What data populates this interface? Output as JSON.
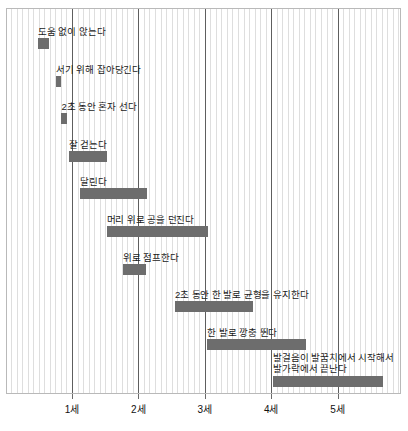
{
  "chart_data": {
    "type": "bar",
    "orientation": "horizontal",
    "title": "",
    "subtitle": "",
    "xlabel": "",
    "ylabel": "",
    "xlim": [
      0,
      5.9
    ],
    "grid": true,
    "grid_minor_step_months": 1,
    "legend": "none",
    "bar_color": "#6d6d6d",
    "axis_ticks": [
      {
        "value": 1,
        "label": "1세"
      },
      {
        "value": 2,
        "label": "2세"
      },
      {
        "value": 3,
        "label": "3세"
      },
      {
        "value": 4,
        "label": "4세"
      },
      {
        "value": 5,
        "label": "5세"
      }
    ],
    "categories": [
      "도움 없이 앉는다",
      "서기 위해 잡아당긴다",
      "2초 동안 혼자 선다",
      "잘 걷는다",
      "달린다",
      "머리 위로 공을 던진다",
      "위로 점프한다",
      "2초 동안 한 발로 균형을 유지한다",
      "한 발로 깡충 뛴다",
      "발걸음이 발꿈치에서 시작해서 발가락에서 끝난다"
    ],
    "bars": [
      {
        "label": "도움 없이 앉는다",
        "start": 0.49,
        "end": 0.66,
        "label_lines": [
          "도움 없이 앉는다"
        ]
      },
      {
        "label": "서기 위해 잡아당긴다",
        "start": 0.76,
        "end": 0.84,
        "label_lines": [
          "서기 위해 잡아당긴다"
        ]
      },
      {
        "label": "2초 동안 혼자 선다",
        "start": 0.84,
        "end": 0.92,
        "label_lines": [
          "2초 동안 혼자 선다"
        ]
      },
      {
        "label": "잘 걷는다",
        "start": 0.95,
        "end": 1.53,
        "label_lines": [
          "잘 걷는다"
        ]
      },
      {
        "label": "달린다",
        "start": 1.12,
        "end": 2.13,
        "label_lines": [
          "달린다"
        ]
      },
      {
        "label": "머리 위로 공을 던진다",
        "start": 1.52,
        "end": 3.05,
        "label_lines": [
          "머리 위로 공을 던진다"
        ]
      },
      {
        "label": "위로 점프한다",
        "start": 1.77,
        "end": 2.12,
        "label_lines": [
          "위로 점프한다"
        ]
      },
      {
        "label": "2초 동안 한 발로 균형을 유지한다",
        "start": 2.55,
        "end": 3.73,
        "label_lines": [
          "2초 동안 한 발로 균형을 유지한다"
        ]
      },
      {
        "label": "한 발로 깡충 뛴다",
        "start": 3.04,
        "end": 4.52,
        "label_lines": [
          "한 발로 깡충 뛴다"
        ]
      },
      {
        "label": "발걸음이 발꿈치에서 시작해서 발가락에서 끝난다",
        "start": 4.03,
        "end": 5.68,
        "label_lines": [
          "발걸음이 발꿈치에서 시작해서",
          "발가락에서 끝난다"
        ]
      }
    ]
  }
}
